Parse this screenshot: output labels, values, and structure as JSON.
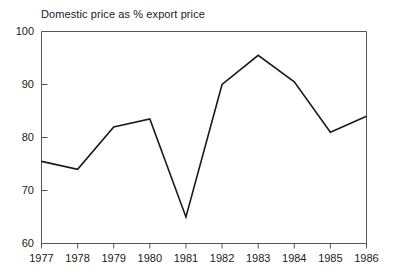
{
  "chart_data": {
    "type": "line",
    "title": "Domestic price as % export price",
    "xlabel": "",
    "ylabel": "",
    "categories": [
      "1977",
      "1978",
      "1979",
      "1980",
      "1981",
      "1982",
      "1983",
      "1984",
      "1985",
      "1986"
    ],
    "values": [
      75.5,
      74.0,
      82.0,
      83.5,
      65.0,
      90.0,
      95.5,
      90.5,
      81.0,
      84.0
    ],
    "series": [
      {
        "name": "Domestic price as % export price",
        "values": [
          75.5,
          74.0,
          82.0,
          83.5,
          65.0,
          90.0,
          95.5,
          90.5,
          81.0,
          84.0
        ]
      }
    ],
    "ylim": [
      60,
      100
    ],
    "ytick_labels": [
      "60",
      "70",
      "80",
      "90",
      "100"
    ],
    "ytick_values": [
      60,
      70,
      80,
      90,
      100
    ],
    "xtick_labels": [
      "1977",
      "1978",
      "1979",
      "1980",
      "1981",
      "1982",
      "1983",
      "1984",
      "1985",
      "1986"
    ],
    "grid": false,
    "legend": "none",
    "line_color": "#1a1a1a",
    "axis_color": "#555555",
    "background_color": "#ffffff"
  }
}
